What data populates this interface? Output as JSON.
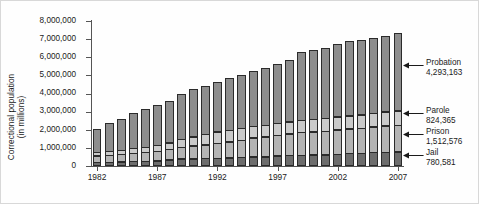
{
  "chart_data": {
    "type": "bar",
    "stacked": true,
    "title": "",
    "xlabel": "",
    "ylabel": "Correctional population\n(in millions)",
    "ylabel_line1": "Correctional population",
    "ylabel_line2": "(in millions)",
    "ylim": [
      0,
      8000000
    ],
    "ytick_values": [
      0,
      1000000,
      2000000,
      3000000,
      4000000,
      5000000,
      6000000,
      7000000,
      8000000
    ],
    "ytick_labels": [
      "0",
      "1,000,000",
      "2,000,000",
      "3,000,000",
      "4,000,000",
      "5,000,000",
      "6,000,000",
      "7,000,000",
      "8,000,000"
    ],
    "grid": false,
    "legend_position": "right-annotations",
    "categories": [
      1982,
      1983,
      1984,
      1985,
      1986,
      1987,
      1988,
      1989,
      1990,
      1991,
      1992,
      1993,
      1994,
      1995,
      1996,
      1997,
      1998,
      1999,
      2000,
      2001,
      2002,
      2003,
      2004,
      2005,
      2006,
      2007
    ],
    "xtick_labels": [
      "1982",
      "1987",
      "1992",
      "1997",
      "2002",
      "2007"
    ],
    "xtick_categories": [
      1982,
      1987,
      1992,
      1997,
      2002,
      2007
    ],
    "series": [
      {
        "name": "Jail",
        "color": "#6d6d6d",
        "values": [
          209582,
          221815,
          233018,
          254986,
          272736,
          294092,
          341893,
          393303,
          405320,
          424129,
          441781,
          455500,
          479800,
          507044,
          518492,
          567079,
          592462,
          605943,
          621149,
          631240,
          665475,
          691301,
          713990,
          747529,
          766010,
          780581
        ]
      },
      {
        "name": "Prison",
        "color": "#b4b4b4",
        "values": [
          395516,
          419820,
          443398,
          480568,
          522084,
          560812,
          603732,
          680907,
          743382,
          792535,
          850566,
          909381,
          990147,
          1078542,
          1127528,
          1176564,
          1224469,
          1287172,
          1316333,
          1330007,
          1367547,
          1390279,
          1421345,
          1448344,
          1492973,
          1512576
        ]
      },
      {
        "name": "Parole",
        "color": "#cacaca",
        "values": [
          224604,
          246440,
          266992,
          300203,
          325638,
          355505,
          407977,
          456803,
          531407,
          590442,
          658601,
          676100,
          690371,
          679421,
          679733,
          694787,
          696385,
          714457,
          723898,
          732333,
          750934,
          769925,
          771852,
          784408,
          798202,
          824365
        ]
      },
      {
        "name": "Probation",
        "color": "#8d8d8d",
        "values": [
          1335359,
          1582947,
          1740948,
          1968712,
          2114621,
          2247158,
          2356483,
          2522125,
          2670234,
          2728472,
          2811611,
          2903061,
          2981022,
          3077861,
          3164996,
          3296513,
          3417613,
          3779922,
          3826209,
          3931731,
          4024067,
          4120012,
          4143792,
          4162536,
          4236800,
          4293163
        ]
      }
    ],
    "annotations": [
      {
        "name": "Probation",
        "value": "4,293,163",
        "series": "Probation"
      },
      {
        "name": "Parole",
        "value": "824,365",
        "series": "Parole"
      },
      {
        "name": "Prison",
        "value": "1,512,576",
        "series": "Prison"
      },
      {
        "name": "Jail",
        "value": "780,581",
        "series": "Jail"
      }
    ]
  }
}
